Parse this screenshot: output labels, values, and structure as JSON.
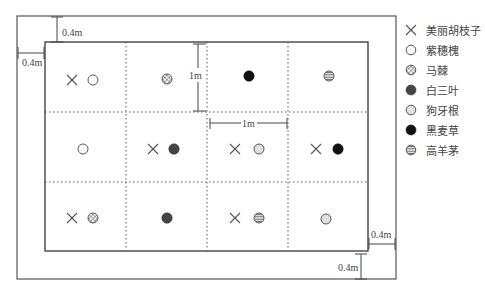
{
  "diagram": {
    "outer_margin_label": "0.4m",
    "cell_size_label": "1m",
    "dimensions": {
      "top_margin": "0.4m",
      "left_margin": "0.4m",
      "right_margin": "0.4m",
      "bottom_margin": "0.4m",
      "cell_height": "1m",
      "cell_width": "1m"
    },
    "grid": {
      "rows": 3,
      "cols": 4,
      "cells": [
        [
          [
            "meili_huzhizi",
            "zisuihuai"
          ],
          [
            "maji"
          ],
          [
            "heimaicao"
          ],
          [
            "gaoyangmao"
          ]
        ],
        [
          [
            "zisuihuai"
          ],
          [
            "meili_huzhizi",
            "baisanye"
          ],
          [
            "meili_huzhizi",
            "gouyagen"
          ],
          [
            "meili_huzhizi",
            "heimaicao"
          ]
        ],
        [
          [
            "meili_huzhizi",
            "maji"
          ],
          [
            "baisanye"
          ],
          [
            "meili_huzhizi",
            "gaoyangmao"
          ],
          [
            "gouyagen"
          ]
        ]
      ]
    }
  },
  "legend": {
    "items": [
      {
        "key": "meili_huzhizi",
        "symbol": "cross-icon",
        "label": "美丽胡枝子"
      },
      {
        "key": "zisuihuai",
        "symbol": "open-circle-icon",
        "label": "紫穗槐"
      },
      {
        "key": "maji",
        "symbol": "crosshatch-circle-icon",
        "label": "马棘"
      },
      {
        "key": "baisanye",
        "symbol": "dark-gray-circle-icon",
        "label": "白三叶"
      },
      {
        "key": "gouyagen",
        "symbol": "dotted-circle-icon",
        "label": "狗牙根"
      },
      {
        "key": "heimaicao",
        "symbol": "black-circle-icon",
        "label": "黑麦草"
      },
      {
        "key": "gaoyangmao",
        "symbol": "striped-circle-icon",
        "label": "高羊茅"
      }
    ]
  },
  "colors": {
    "line": "#555555",
    "text": "#444444",
    "black_fill": "#111111",
    "dark_gray_fill": "#444444"
  }
}
